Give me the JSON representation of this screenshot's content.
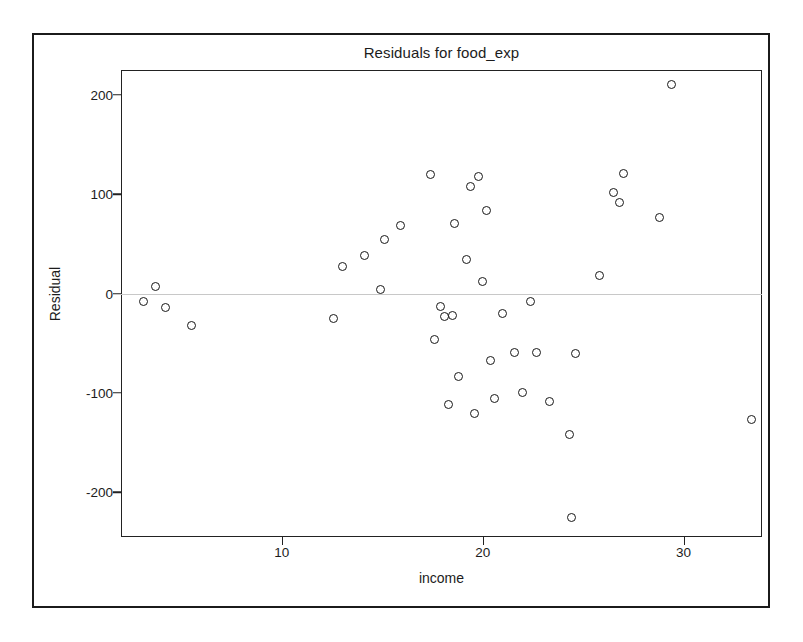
{
  "chart_data": {
    "type": "scatter",
    "title": "Residuals for food_exp",
    "xlabel": "income",
    "ylabel": "Residual",
    "xlim": [
      2.0,
      33.9
    ],
    "ylim": [
      -245,
      225
    ],
    "xticks": [
      10,
      20,
      30
    ],
    "xtick_labels": [
      "10",
      "20",
      "30"
    ],
    "yticks": [
      200,
      100,
      0,
      -100,
      -200
    ],
    "ytick_labels": [
      "200",
      "100",
      "0",
      "-100",
      "-200"
    ],
    "grid": false,
    "legend": null,
    "zero_reference_line": 0,
    "marker": "open-circle",
    "n_points": 40,
    "x": [
      3.1,
      3.7,
      4.2,
      5.5,
      12.6,
      13.0,
      14.1,
      14.9,
      15.1,
      15.9,
      17.4,
      17.6,
      17.9,
      18.1,
      18.3,
      18.5,
      18.6,
      18.8,
      19.2,
      19.4,
      19.6,
      19.8,
      20.0,
      20.2,
      20.4,
      20.6,
      21.0,
      21.6,
      22.0,
      22.4,
      22.7,
      23.3,
      24.3,
      24.4,
      24.6,
      25.8,
      26.5,
      26.8,
      27.0,
      28.8,
      29.4,
      33.4
    ],
    "y": [
      -8,
      7,
      -14,
      -32,
      -25,
      27,
      38,
      4,
      54,
      68,
      120,
      -46,
      -13,
      -23,
      -112,
      -22,
      71,
      -83,
      34,
      108,
      -121,
      118,
      12,
      84,
      -67,
      -106,
      -20,
      -59,
      -100,
      -8,
      -59,
      -109,
      -142,
      -225,
      -60,
      18,
      102,
      92,
      121,
      77,
      210,
      -127,
      -51
    ]
  },
  "figure": {
    "outer_border_color": "#1b1b1b",
    "plot_border_color": "#222222",
    "zero_line_color": "#c8c8c8",
    "marker_edge_color": "#181818",
    "background": "#ffffff"
  }
}
